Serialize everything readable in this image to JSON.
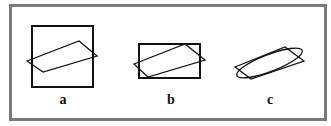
{
  "figure": {
    "panels": [
      {
        "label": "a",
        "shape": "square",
        "description": "Square containing an inclined parallelogram"
      },
      {
        "label": "b",
        "shape": "rectangle",
        "description": "Rectangle containing an inclined parallelogram"
      },
      {
        "label": "c",
        "shape": "ellipse",
        "description": "Ellipse inscribed in an inclined parallelogram"
      }
    ],
    "colors": {
      "frame": "#7a7a7a",
      "stroke": "#111111",
      "background": "#ffffff"
    }
  }
}
